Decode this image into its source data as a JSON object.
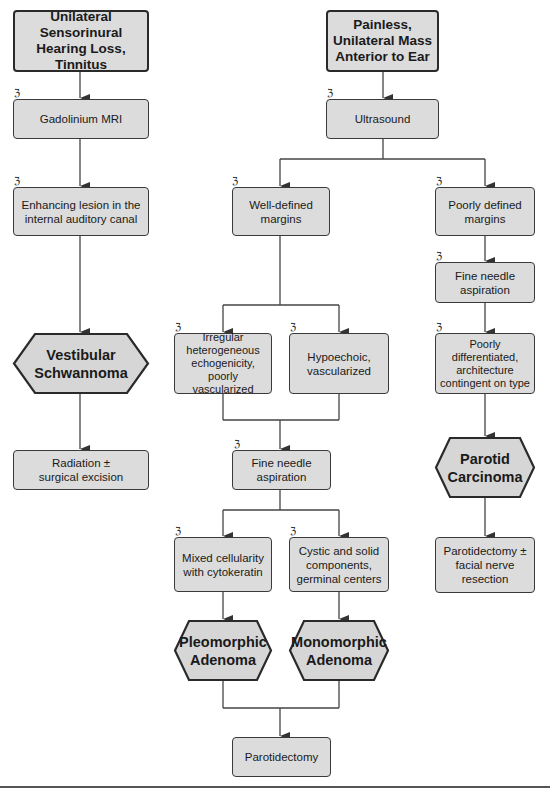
{
  "flowchart": {
    "left_branch": {
      "presentation": "Unilateral Sensorinural\nHearing Loss,\nTinnitus",
      "test": "Gadolinium MRI",
      "finding": "Enhancing lesion in the\ninternal auditory canal",
      "diagnosis": "Vestibular\nSchwannoma",
      "treatment": "Radiation ±\nsurgical excision"
    },
    "right_branch": {
      "presentation": "Painless,\nUnilateral Mass\nAnterior to Ear",
      "test": "Ultrasound",
      "well_defined": {
        "label": "Well-defined\nmargins",
        "finding_a": "Irregular\nheterogeneous\nechogenicity,\npoorly vascularized",
        "finding_b": "Hypoechoic,\nvascularized",
        "test": "Fine needle\naspiration",
        "cytology_a": "Mixed cellularity\nwith cytokeratin",
        "cytology_b": "Cystic and solid\ncomponents,\ngerminal centers",
        "diagnosis_a": "Pleomorphic\nAdenoma",
        "diagnosis_b": "Monomorphic\nAdenoma",
        "treatment": "Parotidectomy"
      },
      "poorly_defined": {
        "label": "Poorly defined\nmargins",
        "test": "Fine needle\naspiration",
        "finding": "Poorly\ndifferentiated,\narchitecture\ncontingent on type",
        "diagnosis": "Parotid\nCarcinoma",
        "treatment": "Parotidectomy ±\nfacial nerve\nresection"
      }
    },
    "step_icon": "microscope-icon",
    "step_icon_glyph": "ℨ",
    "colors": {
      "box_fill": "#dcdcdc",
      "border": "#3a3a3a",
      "line": "#444444"
    }
  }
}
